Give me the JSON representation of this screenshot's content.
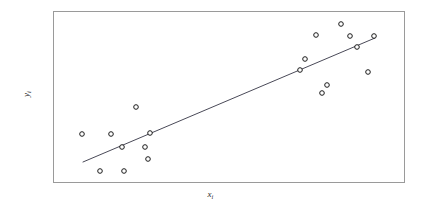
{
  "figure": {
    "background_color": "#ffffff",
    "frame": {
      "x": 53,
      "y": 11,
      "width": 351,
      "height": 171,
      "border_color": "#9a9a9a",
      "border_width": 1,
      "fill": "#ffffff"
    }
  },
  "labels": {
    "y_axis_var": "y",
    "y_axis_sub": "i",
    "x_axis_var": "x",
    "x_axis_sub": "i"
  },
  "chart_data": {
    "type": "scatter",
    "title": "",
    "subtitle": "",
    "xlabel": "xᵢ",
    "ylabel": "yᵢ",
    "xlim": [
      0,
      100
    ],
    "ylim": [
      0,
      100
    ],
    "grid": false,
    "legend": false,
    "legend_position": "none",
    "axis_ticks": false,
    "axis_tick_labels": false,
    "marker": {
      "shape": "circle-open",
      "diameter_px": 4.6,
      "stroke_color": "#1a1a1a",
      "stroke_width": 1,
      "fill": "#ffffff"
    },
    "points_px": [
      {
        "x": 82,
        "y": 134
      },
      {
        "x": 100,
        "y": 171
      },
      {
        "x": 111,
        "y": 134
      },
      {
        "x": 122,
        "y": 147
      },
      {
        "x": 124,
        "y": 171
      },
      {
        "x": 136,
        "y": 107
      },
      {
        "x": 145,
        "y": 147
      },
      {
        "x": 148,
        "y": 159
      },
      {
        "x": 150,
        "y": 133
      },
      {
        "x": 300,
        "y": 70
      },
      {
        "x": 305,
        "y": 59
      },
      {
        "x": 316,
        "y": 35
      },
      {
        "x": 322,
        "y": 93
      },
      {
        "x": 327,
        "y": 85
      },
      {
        "x": 341,
        "y": 24
      },
      {
        "x": 350,
        "y": 36
      },
      {
        "x": 357,
        "y": 47
      },
      {
        "x": 368,
        "y": 72
      },
      {
        "x": 374,
        "y": 36
      }
    ],
    "points": [
      {
        "x": 8.3,
        "y": 28.1
      },
      {
        "x": 13.4,
        "y": 6.4
      },
      {
        "x": 16.5,
        "y": 28.1
      },
      {
        "x": 19.7,
        "y": 20.5
      },
      {
        "x": 20.2,
        "y": 6.4
      },
      {
        "x": 23.6,
        "y": 43.9
      },
      {
        "x": 26.2,
        "y": 20.5
      },
      {
        "x": 27.1,
        "y": 13.5
      },
      {
        "x": 27.6,
        "y": 28.7
      },
      {
        "x": 70.4,
        "y": 65.5
      },
      {
        "x": 71.8,
        "y": 71.9
      },
      {
        "x": 74.9,
        "y": 86.0
      },
      {
        "x": 76.6,
        "y": 52.0
      },
      {
        "x": 78.1,
        "y": 56.7
      },
      {
        "x": 82.1,
        "y": 92.4
      },
      {
        "x": 84.6,
        "y": 85.4
      },
      {
        "x": 86.6,
        "y": 78.9
      },
      {
        "x": 89.7,
        "y": 64.3
      },
      {
        "x": 91.5,
        "y": 85.4
      }
    ],
    "fit_line": {
      "label": "regression line",
      "color": "#4a4a58",
      "width": 1,
      "x0_px": 83,
      "y0_px": 162,
      "x1_px": 375,
      "y1_px": 38,
      "x0": 8.5,
      "y0": 11.7,
      "x1": 91.7,
      "y1": 84.2
    }
  }
}
